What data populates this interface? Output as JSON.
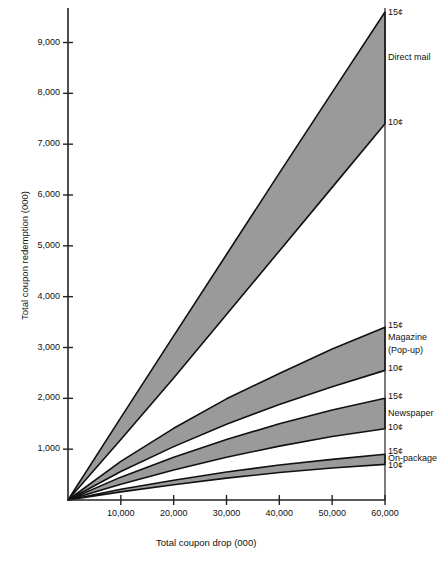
{
  "chart_data": {
    "type": "area",
    "title": "",
    "xlabel": "Total coupon drop (000)",
    "ylabel": "Total coupon redemption (000)",
    "xlim": [
      0,
      60000
    ],
    "ylim": [
      0,
      9600
    ],
    "grid": false,
    "legend_position": "right-inline",
    "xticks": [
      10000,
      20000,
      30000,
      40000,
      50000,
      60000
    ],
    "xtick_labels": [
      "10,000",
      "20,000",
      "30,000",
      "40,000",
      "50,000",
      "60,000"
    ],
    "yticks": [
      1000,
      2000,
      3000,
      4000,
      5000,
      6000,
      7000,
      8000,
      9000
    ],
    "ytick_labels": [
      "1,000",
      "2,000",
      "3,000",
      "4,000",
      "5,000",
      "6,000",
      "7,000",
      "8,000",
      "9,000"
    ],
    "x": [
      0,
      10000,
      20000,
      30000,
      40000,
      50000,
      60000
    ],
    "bands": [
      {
        "name": "Direct mail",
        "upper_label": "15¢",
        "lower_label": "10¢",
        "upper_values": [
          0,
          1620,
          3230,
          4830,
          6430,
          8020,
          9600
        ],
        "lower_values": [
          0,
          1190,
          2400,
          3650,
          4900,
          6150,
          7400
        ]
      },
      {
        "name": "Magazine (Pop-up)",
        "upper_label": "15¢",
        "lower_label": "10¢",
        "upper_values": [
          0,
          760,
          1410,
          1990,
          2490,
          2970,
          3400
        ],
        "lower_values": [
          0,
          560,
          1050,
          1490,
          1880,
          2230,
          2550
        ]
      },
      {
        "name": "Newspaper",
        "upper_label": "15¢",
        "lower_label": "10¢",
        "upper_values": [
          0,
          450,
          840,
          1190,
          1500,
          1770,
          2000
        ],
        "lower_values": [
          0,
          310,
          590,
          840,
          1060,
          1250,
          1400
        ]
      },
      {
        "name": "On-package",
        "upper_label": "15¢",
        "lower_label": "10¢",
        "upper_values": [
          0,
          210,
          390,
          550,
          690,
          800,
          900
        ],
        "lower_values": [
          0,
          160,
          300,
          430,
          540,
          630,
          700
        ]
      }
    ],
    "series_labels": [
      {
        "key": "dm15",
        "text": "15¢"
      },
      {
        "key": "dmname",
        "text": "Direct mail"
      },
      {
        "key": "dm10",
        "text": "10¢"
      },
      {
        "key": "mg15",
        "text": "15¢"
      },
      {
        "key": "mgname1",
        "text": "Magazine"
      },
      {
        "key": "mgname2",
        "text": "(Pop-up)"
      },
      {
        "key": "mg10",
        "text": "10¢"
      },
      {
        "key": "np15",
        "text": "15¢"
      },
      {
        "key": "npname",
        "text": "Newspaper"
      },
      {
        "key": "np10",
        "text": "10¢"
      },
      {
        "key": "op15",
        "text": "15¢"
      },
      {
        "key": "opname",
        "text": "On-package"
      },
      {
        "key": "op10",
        "text": "10¢"
      }
    ],
    "colors": {
      "band_fill": "#9a9a9a",
      "band_stroke": "#111111",
      "axis": "#222222",
      "text": "#111111",
      "background": "#ffffff"
    }
  },
  "axes": {
    "x_title": "Total coupon drop (000)",
    "y_title": "Total coupon redemption (000)"
  }
}
